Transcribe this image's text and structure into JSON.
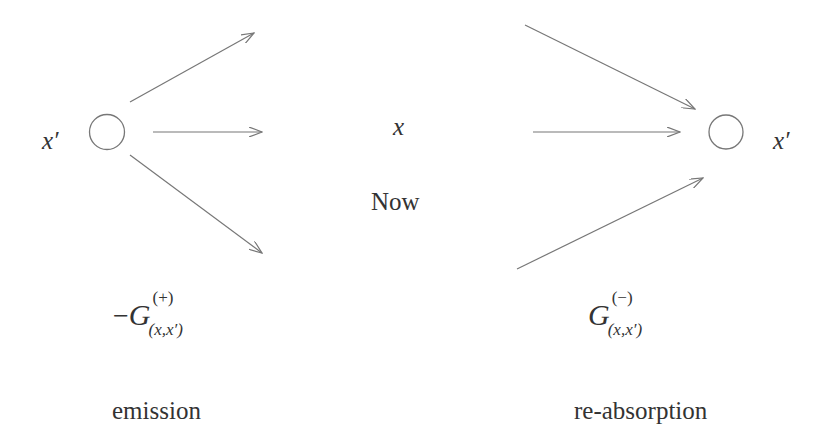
{
  "diagram": {
    "colors": {
      "line": "#777777",
      "text": "#333333",
      "background": "#ffffff"
    },
    "left": {
      "point_label": "x′",
      "green_function": {
        "sign": "−",
        "symbol": "G",
        "superscript": "(+)",
        "subscript": "(x,x′)"
      },
      "caption": "emission",
      "arrows": [
        {
          "x1": 130,
          "y1": 102,
          "x2": 254,
          "y2": 33
        },
        {
          "x1": 153,
          "y1": 132,
          "x2": 262,
          "y2": 132
        },
        {
          "x1": 130,
          "y1": 155,
          "x2": 262,
          "y2": 253
        }
      ]
    },
    "center": {
      "point_label": "x",
      "time_label": "Now"
    },
    "right": {
      "point_label": "x′",
      "green_function": {
        "sign": "",
        "symbol": "G",
        "superscript": "(−)",
        "subscript": "(x,x′)"
      },
      "caption": "re-absorption",
      "arrows": [
        {
          "x1": 525,
          "y1": 25,
          "x2": 695,
          "y2": 109
        },
        {
          "x1": 533,
          "y1": 132,
          "x2": 680,
          "y2": 132
        },
        {
          "x1": 517,
          "y1": 269,
          "x2": 703,
          "y2": 178
        }
      ]
    }
  }
}
